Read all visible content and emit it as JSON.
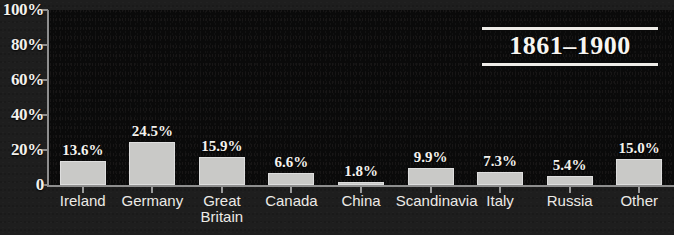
{
  "title": "1861–1900",
  "axis": {
    "y_ticks": [
      "100%",
      "80%",
      "60%",
      "40%",
      "20%",
      "0"
    ],
    "zero_label": "0"
  },
  "chart_data": {
    "type": "bar",
    "title": "1861–1900",
    "subtitle": "",
    "xlabel": "",
    "ylabel": "",
    "ylim": [
      0,
      100
    ],
    "ytick_labels": [
      "0",
      "20%",
      "40%",
      "60%",
      "80%",
      "100%"
    ],
    "ytick_values": [
      0,
      20,
      40,
      60,
      80,
      100
    ],
    "grid": false,
    "legend": false,
    "categories": [
      "Ireland",
      "Germany",
      "Great Britain",
      "Canada",
      "China",
      "Scandinavia",
      "Italy",
      "Russia",
      "Other"
    ],
    "category_labels": [
      "Ireland",
      "Germany",
      "Great\nBritain",
      "Canada",
      "China",
      "Scandinavia",
      "Italy",
      "Russia",
      "Other"
    ],
    "values": [
      13.6,
      24.5,
      15.9,
      6.6,
      1.8,
      9.9,
      7.3,
      5.4,
      15.0
    ],
    "value_labels": [
      "13.6%",
      "24.5%",
      "15.9%",
      "6.6%",
      "1.8%",
      "9.9%",
      "7.3%",
      "5.4%",
      "15.0%"
    ],
    "colors": {
      "bar_fill": "#c9c9c7",
      "bar_edge": "#dedede",
      "plot_background": "#0a0a0a",
      "figure_background": "#1e1e1e",
      "text": "#f2f0ec",
      "axis": "#8e8e8e"
    }
  }
}
